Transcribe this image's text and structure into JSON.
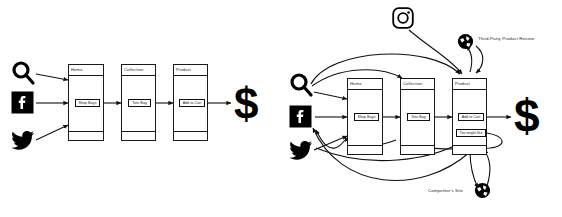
{
  "diagram": {
    "title_left": "Linear Purchase Funnel",
    "title_right": "Multi-Touchpoint Customer Journey",
    "stroke_color": "#1a1a1a",
    "accent_color": "#000000"
  },
  "left": {
    "sources": [
      {
        "name": "search-icon",
        "label": "Search"
      },
      {
        "name": "facebook-icon",
        "label": "Facebook"
      },
      {
        "name": "twitter-icon",
        "label": "Twitter"
      }
    ],
    "screens": [
      {
        "title": "Home",
        "button": "Shop Bags"
      },
      {
        "title": "Collection",
        "button": "Tote Bag"
      },
      {
        "title": "Product",
        "button": "Add to Cart"
      }
    ],
    "conversion": "$"
  },
  "right": {
    "sources": [
      {
        "name": "search-icon",
        "label": "Search"
      },
      {
        "name": "facebook-icon",
        "label": "Facebook"
      },
      {
        "name": "twitter-icon",
        "label": "Twitter"
      },
      {
        "name": "instagram-icon",
        "label": "Instagram"
      }
    ],
    "screens": [
      {
        "title": "Home",
        "button": "Shop Bags"
      },
      {
        "title": "Collection",
        "button": "Tote Bag"
      },
      {
        "title": "Product",
        "button": "Add to Cart",
        "button2": "You might like"
      }
    ],
    "external": [
      {
        "name": "third-party-review",
        "label": "Third-Party Product Review",
        "icon": "globe-icon"
      },
      {
        "name": "competitor-site",
        "label": "Competitor's Site",
        "icon": "globe-icon"
      }
    ],
    "conversion": "$"
  }
}
